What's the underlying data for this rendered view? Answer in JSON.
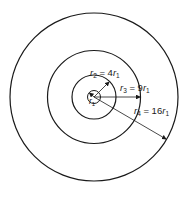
{
  "diagram": {
    "type": "concentric-circles",
    "colors": {
      "stroke": "#1a1a1a",
      "background": "#ffffff"
    },
    "circles": [
      {
        "id": "r1",
        "label_var": "r",
        "label_sub": "1",
        "relation": ""
      },
      {
        "id": "r2",
        "label_var": "r",
        "label_sub": "2",
        "eq": " = 4",
        "rhs_var": "r",
        "rhs_sub": "1"
      },
      {
        "id": "r3",
        "label_var": "r",
        "label_sub": "3",
        "eq": " = 9",
        "rhs_var": "r",
        "rhs_sub": "1"
      },
      {
        "id": "r4",
        "label_var": "r",
        "label_sub": "4",
        "eq": " = 16",
        "rhs_var": "r",
        "rhs_sub": "1"
      }
    ]
  }
}
